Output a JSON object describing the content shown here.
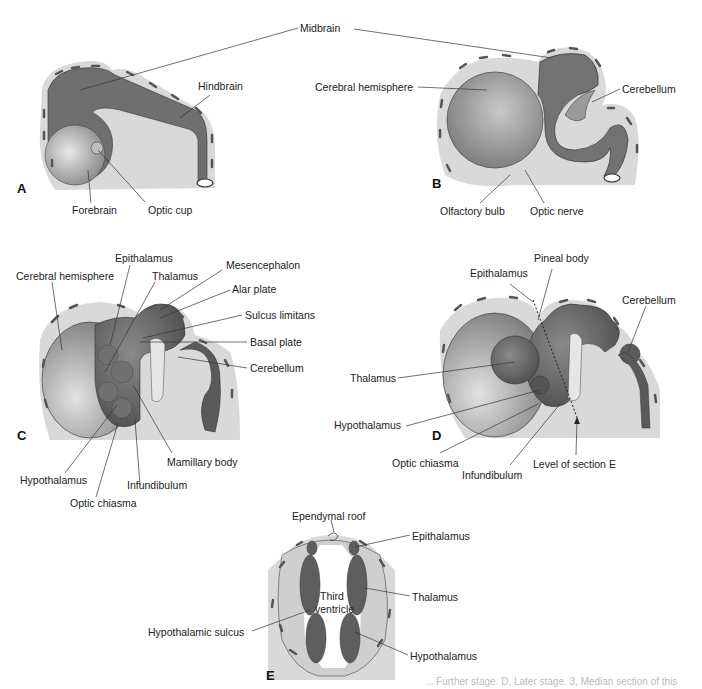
{
  "figure": {
    "panels": {
      "A": {
        "letter": "A",
        "labels": {
          "midbrain": "Midbrain",
          "hindbrain": "Hindbrain",
          "forebrain": "Forebrain",
          "optic_cup": "Optic cup"
        }
      },
      "B": {
        "letter": "B",
        "labels": {
          "cerebral_hemisphere": "Cerebral hemisphere",
          "cerebellum": "Cerebellum",
          "olfactory_bulb": "Olfactory bulb",
          "optic_nerve": "Optic nerve"
        }
      },
      "C": {
        "letter": "C",
        "labels": {
          "epithalamus": "Epithalamus",
          "cerebral_hemisphere": "Cerebral hemisphere",
          "thalamus": "Thalamus",
          "mesencephalon": "Mesencephalon",
          "alar_plate": "Alar plate",
          "sulcus_limitans": "Sulcus limitans",
          "basal_plate": "Basal plate",
          "cerebellum": "Cerebellum",
          "mamillary_body": "Mamillary body",
          "hypothalamus": "Hypothalamus",
          "infundibulum": "Infundibulum",
          "optic_chiasma": "Optic chiasma"
        }
      },
      "D": {
        "letter": "D",
        "labels": {
          "pineal_body": "Pineal body",
          "epithalamus": "Epithalamus",
          "cerebellum": "Cerebellum",
          "thalamus": "Thalamus",
          "hypothalamus": "Hypothalamus",
          "optic_chiasma": "Optic chiasma",
          "infundibulum": "Infundibulum",
          "level_section_e": "Level of section E"
        }
      },
      "E": {
        "letter": "E",
        "labels": {
          "ependymal_roof": "Ependymal roof",
          "epithalamus": "Epithalamus",
          "third_ventricle_1": "Third",
          "third_ventricle_2": "ventricle",
          "thalamus": "Thalamus",
          "hypothalamic_sulcus": "Hypothalamic sulcus",
          "hypothalamus": "Hypothalamus"
        }
      }
    },
    "caption_fragment": "... Further stage. D, Later stage. 3, Median section of this"
  },
  "colors": {
    "tissue_dark": "#5f5f5f",
    "tissue_mid": "#8a8a8a",
    "tissue_light": "#b5b5b5",
    "mesenchyme": "#d9d9d9",
    "line": "#333333"
  }
}
